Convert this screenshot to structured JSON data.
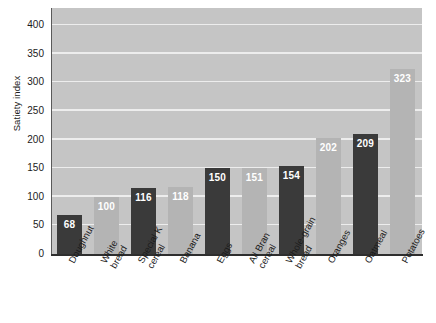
{
  "chart_data": {
    "type": "bar",
    "title": "",
    "xlabel": "",
    "ylabel": "Satiety index",
    "ylim": [
      0,
      430
    ],
    "yticks": [
      0,
      50,
      100,
      150,
      200,
      250,
      300,
      350,
      400
    ],
    "grid": true,
    "legend": "none",
    "categories": [
      "Doughnut",
      "White bread",
      "Special K cereal",
      "Banana",
      "Eggs",
      "All Bran cereal",
      "Whole-grain bread",
      "Oranges",
      "Oatmeal",
      "Potatoes"
    ],
    "values": [
      68,
      100,
      116,
      118,
      150,
      151,
      154,
      202,
      209,
      323
    ],
    "bar_colors": [
      "#3a3a3a",
      "#b4b4b4",
      "#3a3a3a",
      "#b4b4b4",
      "#3a3a3a",
      "#b4b4b4",
      "#3a3a3a",
      "#b4b4b4",
      "#3a3a3a",
      "#b4b4b4"
    ]
  },
  "axis": {
    "y_title": "Satiety index",
    "y_tick_labels": [
      "400",
      "350",
      "300",
      "250",
      "200",
      "150",
      "100",
      "50",
      "0"
    ]
  },
  "categories_lines": [
    {
      "l1": "Doughnut",
      "l2": ""
    },
    {
      "l1": "White",
      "l2": "bread"
    },
    {
      "l1": "Special K",
      "l2": "cereal"
    },
    {
      "l1": "Banana",
      "l2": ""
    },
    {
      "l1": "Eggs",
      "l2": ""
    },
    {
      "l1": "All Bran",
      "l2": "cereal"
    },
    {
      "l1": "Whole-grain",
      "l2": "bread"
    },
    {
      "l1": "Oranges",
      "l2": ""
    },
    {
      "l1": "Oatmeal",
      "l2": ""
    },
    {
      "l1": "Potatoes",
      "l2": ""
    }
  ],
  "value_labels": [
    "68",
    "100",
    "116",
    "118",
    "150",
    "151",
    "154",
    "202",
    "209",
    "323"
  ],
  "colors": {
    "plot_background": "#c5c5c5",
    "gridline": "#ededed",
    "bar_dark": "#3a3a3a",
    "bar_light": "#b4b4b4",
    "axis": "#2e2e2e",
    "text": "#1b1b1b",
    "value_text": "#ffffff"
  }
}
